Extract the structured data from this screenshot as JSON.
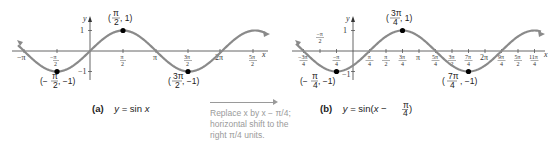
{
  "graph_a": {
    "caption_label": "(a)",
    "caption_eq": "y = sin x",
    "x_axis_label": "x",
    "y_axis_label": "y",
    "y_ticks": [
      "1",
      "−1"
    ],
    "x_ticks": [
      "−π",
      "−π/2",
      "π/2",
      "π",
      "3π/2",
      "2π",
      "5π/2"
    ],
    "points": [
      {
        "label": "(π/2, 1)",
        "x": "π/2",
        "y": 1
      },
      {
        "label": "(−π/2, −1)",
        "x": "−π/2",
        "y": -1
      },
      {
        "label": "(3π/2, −1)",
        "x": "3π/2",
        "y": -1
      }
    ]
  },
  "graph_b": {
    "caption_label": "(b)",
    "caption_eq": "y = sin(x − π/4)",
    "x_axis_label": "x",
    "y_axis_label": "y",
    "y_ticks": [
      "1",
      "−1"
    ],
    "x_ticks": [
      "−3π/4",
      "−π/2",
      "−π/4",
      "π/4",
      "π/2",
      "3π/4",
      "π",
      "5π/4",
      "3π/2",
      "7π/4",
      "2π",
      "9π/4",
      "5π/2",
      "11π/4"
    ],
    "points": [
      {
        "label": "(3π/4, 1)",
        "x": "3π/4",
        "y": 1
      },
      {
        "label": "(−π/4, −1)",
        "x": "−π/4",
        "y": -1
      },
      {
        "label": "(7π/4, −1)",
        "x": "7π/4",
        "y": -1
      }
    ]
  },
  "transform_note": {
    "line1": "Replace x by x − π/4;",
    "line2": "horizontal shift to the",
    "line3": "right π/4 units."
  },
  "colors": {
    "curve": "#8a8a8a",
    "axis": "#555555",
    "point": "#000000",
    "note": "#9a9a9a"
  }
}
